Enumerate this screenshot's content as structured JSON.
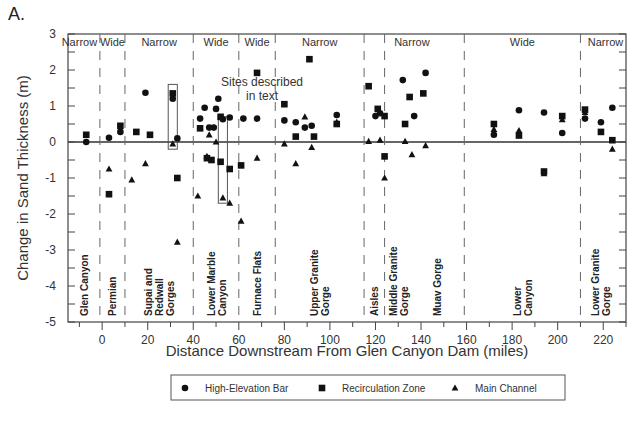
{
  "chart_data": {
    "type": "scatter",
    "panel_label": "A.",
    "title": "",
    "xlabel": "Distance Downstream From Glen Canyon Dam (miles)",
    "ylabel": "Change in Sand Thickness (m)",
    "xlim": [
      -15,
      230
    ],
    "ylim": [
      -5,
      3
    ],
    "xticks": [
      0,
      20,
      40,
      60,
      80,
      100,
      120,
      140,
      160,
      180,
      200,
      220
    ],
    "xtick_labels": [
      "0",
      "20",
      "40",
      "60",
      "80",
      "100",
      "120",
      "140",
      "160",
      "180",
      "200",
      "220"
    ],
    "x_minor_step": 10,
    "yticks": [
      3,
      2,
      1,
      0,
      -1,
      -2,
      -3,
      -4,
      -5
    ],
    "ytick_labels": [
      "3",
      "2",
      "1",
      "0",
      "-1",
      "-2",
      "-3",
      "-4",
      "-5"
    ],
    "y_minor_step": 0.5,
    "zero_line": true,
    "grid": false,
    "region_boundaries": [
      -1,
      10,
      40,
      60,
      76,
      115,
      124,
      159,
      210
    ],
    "width_labels": [
      {
        "label": "Narrow",
        "x": -10
      },
      {
        "label": "Wide",
        "x": 4.5
      },
      {
        "label": "Narrow",
        "x": 25
      },
      {
        "label": "Wide",
        "x": 50
      },
      {
        "label": "Wide",
        "x": 68
      },
      {
        "label": "Narrow",
        "x": 95.5
      },
      {
        "label": "Narrow",
        "x": 136
      },
      {
        "label": "Wide",
        "x": 184.5
      },
      {
        "label": "Narrow",
        "x": 221
      }
    ],
    "reach_names": [
      {
        "lines": [
          "Glen Canyon"
        ],
        "x": -8
      },
      {
        "lines": [
          "Permian"
        ],
        "x": 4.5
      },
      {
        "lines": [
          "Supai and",
          "Redwall",
          "Gorges"
        ],
        "x": 25
      },
      {
        "lines": [
          "Lower Marble",
          "Canyon"
        ],
        "x": 50
      },
      {
        "lines": [
          "Furnace Flats"
        ],
        "x": 68
      },
      {
        "lines": [
          "Upper Granite",
          "Gorge"
        ],
        "x": 95.5
      },
      {
        "lines": [
          "Aisles"
        ],
        "x": 119.5
      },
      {
        "lines": [
          "Middle Granite",
          "Gorge"
        ],
        "x": 130
      },
      {
        "lines": [
          "Muav Gorge"
        ],
        "x": 147
      },
      {
        "lines": [
          "Lower",
          "Canyon"
        ],
        "x": 184.5
      },
      {
        "lines": [
          "Lower Granite",
          "Gorge"
        ],
        "x": 219
      }
    ],
    "annotation": {
      "text_lines": [
        "Sites described",
        "in text"
      ],
      "boxes": [
        {
          "x_range": [
            29,
            33
          ],
          "y_range": [
            -0.2,
            1.6
          ]
        },
        {
          "x_range": [
            51,
            55
          ],
          "y_range": [
            -1.7,
            0.7
          ]
        }
      ]
    },
    "series": [
      {
        "name": "High-Elevation Bar",
        "marker": "circle",
        "points": [
          [
            -7,
            0.0
          ],
          [
            3,
            0.12
          ],
          [
            8,
            0.28
          ],
          [
            19,
            1.37
          ],
          [
            31,
            1.2
          ],
          [
            33,
            0.1
          ],
          [
            43,
            0.65
          ],
          [
            45,
            0.95
          ],
          [
            47,
            0.4
          ],
          [
            49,
            0.4
          ],
          [
            50,
            0.92
          ],
          [
            51,
            1.2
          ],
          [
            53,
            0.63
          ],
          [
            56,
            0.68
          ],
          [
            62,
            0.65
          ],
          [
            68,
            0.65
          ],
          [
            80,
            0.6
          ],
          [
            85,
            0.55
          ],
          [
            89,
            0.4
          ],
          [
            92,
            0.45
          ],
          [
            103,
            0.75
          ],
          [
            120,
            0.72
          ],
          [
            122,
            0.8
          ],
          [
            132,
            1.72
          ],
          [
            137,
            0.72
          ],
          [
            142,
            1.92
          ],
          [
            172,
            0.2
          ],
          [
            183,
            0.88
          ],
          [
            194,
            0.82
          ],
          [
            202,
            0.25
          ],
          [
            212,
            0.65
          ],
          [
            219,
            0.55
          ],
          [
            224,
            0.95
          ]
        ]
      },
      {
        "name": "Recirculation Zone",
        "marker": "square",
        "points": [
          [
            -7,
            0.2
          ],
          [
            3,
            -1.45
          ],
          [
            8,
            0.45
          ],
          [
            15,
            0.28
          ],
          [
            21,
            0.2
          ],
          [
            31,
            1.35
          ],
          [
            33,
            -1.0
          ],
          [
            43,
            0.38
          ],
          [
            46,
            -0.45
          ],
          [
            48,
            -0.5
          ],
          [
            52,
            0.7
          ],
          [
            52,
            -0.55
          ],
          [
            56,
            -0.75
          ],
          [
            61,
            -0.65
          ],
          [
            68,
            1.92
          ],
          [
            80,
            1.05
          ],
          [
            85,
            0.15
          ],
          [
            91,
            2.3
          ],
          [
            93,
            0.15
          ],
          [
            103,
            0.5
          ],
          [
            117,
            1.55
          ],
          [
            121,
            0.92
          ],
          [
            124,
            -0.4
          ],
          [
            124,
            0.72
          ],
          [
            133,
            0.5
          ],
          [
            135,
            1.25
          ],
          [
            141,
            1.35
          ],
          [
            172,
            0.5
          ],
          [
            183,
            0.18
          ],
          [
            194,
            -0.82
          ],
          [
            202,
            0.72
          ],
          [
            212,
            0.9
          ],
          [
            219,
            0.28
          ],
          [
            224,
            0.05
          ]
        ]
      },
      {
        "name": "Main Channel",
        "marker": "triangle",
        "points": [
          [
            3,
            -0.75
          ],
          [
            13,
            -1.05
          ],
          [
            19,
            -0.6
          ],
          [
            31,
            -0.05
          ],
          [
            33,
            -2.78
          ],
          [
            42,
            -1.5
          ],
          [
            46,
            -0.4
          ],
          [
            47,
            0.2
          ],
          [
            50,
            0.0
          ],
          [
            53,
            -1.55
          ],
          [
            56,
            -1.7
          ],
          [
            61,
            -2.2
          ],
          [
            68,
            -0.45
          ],
          [
            80,
            -0.05
          ],
          [
            85,
            -0.6
          ],
          [
            89,
            0.7
          ],
          [
            92,
            -0.15
          ],
          [
            103,
            0.55
          ],
          [
            117,
            0.02
          ],
          [
            122,
            0.05
          ],
          [
            124,
            -1.0
          ],
          [
            133,
            0.02
          ],
          [
            136,
            -0.35
          ],
          [
            142,
            -0.1
          ],
          [
            172,
            0.35
          ],
          [
            183,
            0.32
          ],
          [
            194,
            -0.88
          ],
          [
            202,
            0.62
          ],
          [
            212,
            0.82
          ],
          [
            224,
            -0.2
          ]
        ]
      }
    ],
    "legend": {
      "placement": "bottom",
      "entries": [
        {
          "label": "High-Elevation Bar",
          "marker": "circle"
        },
        {
          "label": "Recirculation Zone",
          "marker": "square"
        },
        {
          "label": "Main Channel",
          "marker": "triangle"
        }
      ]
    },
    "colors": {
      "marker": "#111111",
      "axis": "#444444",
      "dash": "#666666",
      "text": "#333333"
    }
  }
}
